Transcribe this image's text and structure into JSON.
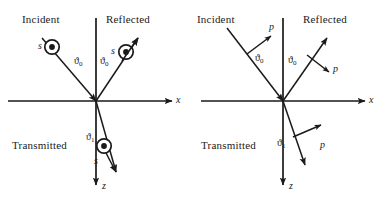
{
  "figure": {
    "ink_color": "#1a1a1a",
    "background_color": "#ffffff"
  },
  "panels": [
    {
      "id": "s-polarization",
      "polarization_label": "s",
      "rays": {
        "incident": {
          "name": "Incident",
          "angle_label": "ϑ",
          "angle_subscript": "0"
        },
        "reflected": {
          "name": "Reflected",
          "angle_label": "ϑ",
          "angle_subscript": "0"
        },
        "transmitted": {
          "name": "Transmitted",
          "angle_label": "ϑ",
          "angle_subscript": "1"
        }
      },
      "axes": {
        "horizontal": "x",
        "vertical": "z"
      },
      "polarization_markers": [
        {
          "ray": "incident",
          "label": "s",
          "symbol": "circled-dot"
        },
        {
          "ray": "reflected",
          "label": "s",
          "symbol": "circled-dot"
        },
        {
          "ray": "transmitted",
          "label": "s",
          "symbol": "circled-dot"
        }
      ]
    },
    {
      "id": "p-polarization",
      "polarization_label": "p",
      "rays": {
        "incident": {
          "name": "Incident",
          "angle_label": "ϑ",
          "angle_subscript": "0"
        },
        "reflected": {
          "name": "Reflected",
          "angle_label": "ϑ",
          "angle_subscript": "0"
        },
        "transmitted": {
          "name": "Transmitted",
          "angle_label": "ϑ",
          "angle_subscript": "1"
        }
      },
      "axes": {
        "horizontal": "x",
        "vertical": "z"
      },
      "polarization_markers": [
        {
          "ray": "incident",
          "label": "p",
          "symbol": "arrow"
        },
        {
          "ray": "reflected",
          "label": "p",
          "symbol": "arrow"
        },
        {
          "ray": "transmitted",
          "label": "p",
          "symbol": "arrow"
        }
      ]
    }
  ]
}
